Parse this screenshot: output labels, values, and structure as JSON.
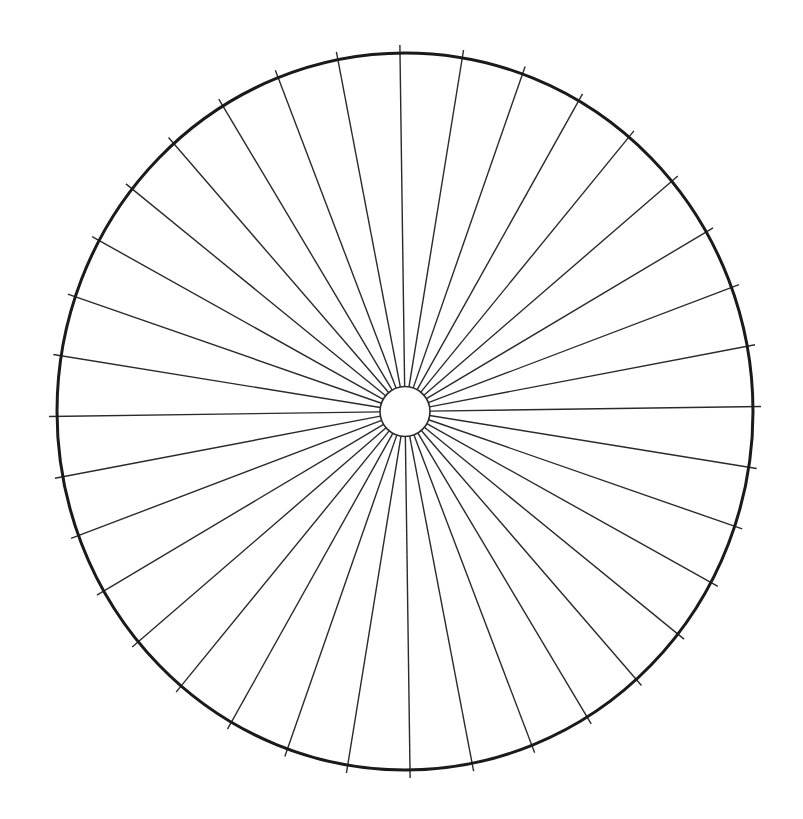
{
  "diagram": {
    "type": "radial-divided-circle",
    "center": {
      "x": 405,
      "y": 411.5
    },
    "outer_radius_x": 348,
    "outer_radius_y": 358.5,
    "inner_radius": 25,
    "spoke_count": 36,
    "spoke_angle_deg": 10,
    "rotation_deg": -0.8,
    "tick_overhang": 8,
    "colors": {
      "background": "#ffffff",
      "outer_circle": "#1a1a1a",
      "spokes": "#2a2a2a",
      "inner_circle": "#2a2a2a",
      "inner_fill": "#ffffff"
    },
    "stroke": {
      "outer": 3,
      "spoke": 1.4,
      "inner": 1.6
    }
  }
}
